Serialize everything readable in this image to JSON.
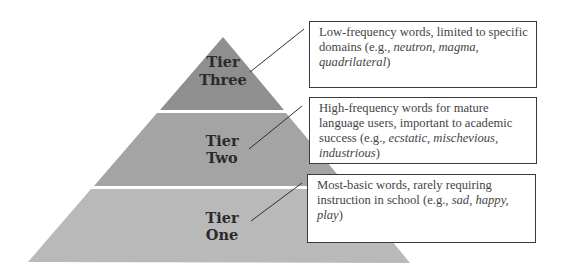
{
  "colors": {
    "tier_three": "#8f8f8f",
    "tier_two": "#a4a4a4",
    "tier_one": "#b9b9b9",
    "line": "#2f2f2f"
  },
  "tiers": [
    {
      "id": "three",
      "label_line1": "Tier",
      "label_line2": "Three",
      "description_prefix": "Low-frequency words, limited to specific domains (e.g., ",
      "examples": "neutron, magma, quadrilateral",
      "description_suffix": ")"
    },
    {
      "id": "two",
      "label_line1": "Tier",
      "label_line2": "Two",
      "description_prefix": "High-frequency words for mature language users, important to academic success (e.g., ",
      "examples": "ecstatic, mischevious, industrious",
      "description_suffix": ")"
    },
    {
      "id": "one",
      "label_line1": "Tier",
      "label_line2": "One",
      "description_prefix": "Most-basic words, rarely requiring instruction in school (e.g., ",
      "examples": "sad, happy, play",
      "description_suffix": ")"
    }
  ]
}
